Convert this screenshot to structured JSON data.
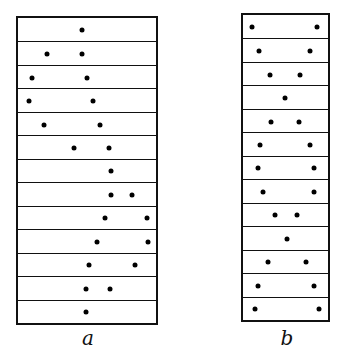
{
  "panels": [
    {
      "label": "a",
      "box": {
        "left": 16,
        "top": 16,
        "right": 158,
        "bottom": 325
      },
      "label_pos": {
        "x": 88,
        "y": 326
      },
      "rows": [
        [
          82
        ],
        [
          47,
          82
        ],
        [
          32,
          87
        ],
        [
          29,
          93
        ],
        [
          44,
          100
        ],
        [
          74,
          109
        ],
        [
          111
        ],
        [
          111,
          132
        ],
        [
          105,
          147
        ],
        [
          97,
          148
        ],
        [
          89,
          135
        ],
        [
          86,
          110
        ],
        [
          86
        ]
      ]
    },
    {
      "label": "b",
      "box": {
        "left": 241,
        "top": 13,
        "right": 330,
        "bottom": 322
      },
      "label_pos": {
        "x": 287,
        "y": 326
      },
      "rows": [
        [
          252,
          317
        ],
        [
          259,
          310
        ],
        [
          270,
          300
        ],
        [
          285
        ],
        [
          271,
          299
        ],
        [
          260,
          310
        ],
        [
          258,
          314
        ],
        [
          263,
          314
        ],
        [
          275,
          297
        ],
        [
          287
        ],
        [
          268,
          306
        ],
        [
          258,
          314
        ],
        [
          255,
          319
        ]
      ]
    }
  ]
}
